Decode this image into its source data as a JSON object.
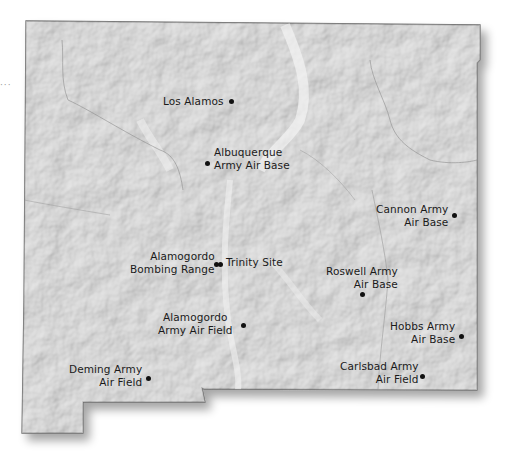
{
  "map": {
    "region": "New Mexico",
    "colors": {
      "terrain": "#c9c9c9",
      "terrain_light": "#e2e2e2",
      "border": "#6e6e6e",
      "dot": "#111111",
      "label": "#1a1a1a"
    },
    "leader_text": "···",
    "locations": [
      {
        "id": "los-alamos",
        "lines": [
          "Los Alamos"
        ],
        "dot": [
          232,
          102
        ]
      },
      {
        "id": "albuquerque",
        "lines": [
          "Albuquerque",
          "Army Air Base"
        ],
        "dot": [
          208,
          164
        ]
      },
      {
        "id": "cannon",
        "lines": [
          "Cannon Army",
          "Air Base"
        ],
        "dot": [
          455,
          216
        ]
      },
      {
        "id": "alamogordo-bombing-range",
        "lines": [
          "Alamogordo",
          "Bombing Range"
        ],
        "dot": [
          216,
          265
        ]
      },
      {
        "id": "trinity-site",
        "lines": [
          "Trinity Site"
        ],
        "dot": [
          220,
          265
        ]
      },
      {
        "id": "roswell",
        "lines": [
          "Roswell Army",
          "Air Base"
        ],
        "dot": [
          362,
          295
        ]
      },
      {
        "id": "alamogordo-army-air-field",
        "lines": [
          "Alamogordo",
          "Army Air Field"
        ],
        "dot": [
          243,
          326
        ]
      },
      {
        "id": "hobbs",
        "lines": [
          "Hobbs Army",
          "Air Base"
        ],
        "dot": [
          461,
          336
        ]
      },
      {
        "id": "carlsbad",
        "lines": [
          "Carlsbad Army",
          "Air Field"
        ],
        "dot": [
          422,
          376
        ]
      },
      {
        "id": "deming",
        "lines": [
          "Deming Army",
          "Air Field"
        ],
        "dot": [
          148,
          378
        ]
      }
    ]
  }
}
